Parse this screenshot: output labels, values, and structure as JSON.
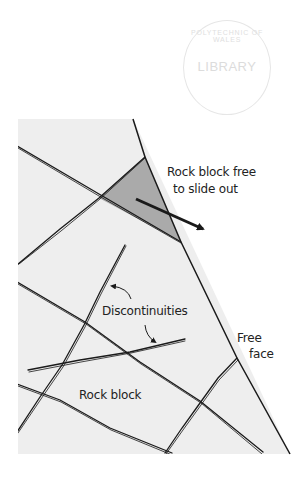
{
  "stamp": {
    "ring_text": "POLYTECHNIC OF WALES",
    "center_text": "LIBRARY"
  },
  "colors": {
    "rock_mass": "#eeeeee",
    "free_block": "#aaaaaa",
    "lines": "#1a1a1a",
    "background": "#ffffff"
  },
  "labels": {
    "free_block_line1": "Rock block free",
    "free_block_line2": "to slide out",
    "discontinuities": "Discontinuities",
    "free_face_line1": "Free",
    "free_face_line2": "face",
    "rock_block": "Rock block"
  },
  "geometry": {
    "rock_mass_polygon": [
      [
        18,
        119
      ],
      [
        133,
        119
      ],
      [
        290,
        454
      ],
      [
        18,
        454
      ]
    ],
    "free_block_triangle": [
      [
        145,
        157
      ],
      [
        99,
        198
      ],
      [
        181,
        242
      ]
    ],
    "free_face": [
      [
        133,
        119
      ],
      [
        290,
        454
      ]
    ],
    "discontinuities": [
      {
        "id": "A",
        "from": [
          17,
          146
        ],
        "to": [
          181,
          242
        ]
      },
      {
        "id": "B",
        "from": [
          17,
          265
        ],
        "to": [
          145,
          157
        ]
      },
      {
        "id": "C",
        "from": [
          17,
          282
        ],
        "to": [
          263,
          452
        ]
      },
      {
        "id": "D",
        "from": [
          125,
          245
        ],
        "to": [
          17,
          432
        ]
      },
      {
        "id": "E",
        "from": [
          28,
          370
        ],
        "to": [
          185,
          339
        ]
      },
      {
        "id": "F",
        "from": [
          17,
          384
        ],
        "to": [
          172,
          453
        ]
      },
      {
        "id": "G",
        "from": [
          237,
          358
        ],
        "to": [
          165,
          453
        ]
      }
    ],
    "slide_arrow": {
      "from": [
        136,
        199
      ],
      "to": [
        205,
        230
      ]
    }
  }
}
